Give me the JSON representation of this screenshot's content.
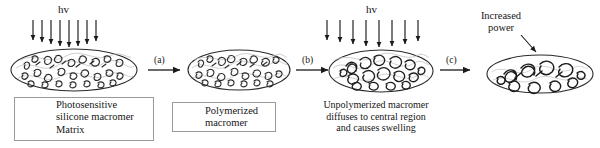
{
  "figure": {
    "background_color": "#ffffff",
    "ink_color": "#161616",
    "matrix_color": "#b9b9b9"
  },
  "light_sources": [
    {
      "id": "hv-left",
      "label": "hv",
      "arrow_count": 8,
      "description": "UV light exposure over entire sample"
    },
    {
      "id": "hv-right",
      "label": "hv",
      "arrow_count": 8,
      "description": "Second UV light exposure, wider spacing"
    }
  ],
  "steps": [
    {
      "id": "a",
      "label": "(a)"
    },
    {
      "id": "b",
      "label": "(b)"
    },
    {
      "id": "c",
      "label": "(c)"
    }
  ],
  "samples": [
    {
      "id": "sample-1",
      "state": "initial",
      "description": "Ellipse filled with unpolymerized photosensitive silicone macromer in matrix"
    },
    {
      "id": "sample-2",
      "state": "partially-polymerized",
      "description": "Ellipse after first exposure"
    },
    {
      "id": "sample-3",
      "state": "swollen",
      "description": "Ellipse with macromer diffused to central region"
    },
    {
      "id": "sample-4",
      "state": "locked-in",
      "description": "Flattened ellipse after increased power exposure"
    }
  ],
  "legend_primary": {
    "items": [
      {
        "icon": "macromer-squiggle-icon",
        "label": "Photosensitive\nsilicone macromer"
      },
      {
        "icon": "matrix-wave-icon",
        "label": "Matrix"
      }
    ],
    "line1": "Photosensitive",
    "line2": "silicone macromer",
    "line3": "Matrix"
  },
  "legend_secondary": {
    "icon": "polymerized-macromer-icon",
    "line1": "Polymerized",
    "line2": "macromer"
  },
  "captions": {
    "diffusion": {
      "line1": "Unpolymerized macromer",
      "line2": "diffuses to central region",
      "line3": "and causes swelling"
    },
    "increased_power": {
      "line1": "Increased",
      "line2": "power"
    }
  }
}
